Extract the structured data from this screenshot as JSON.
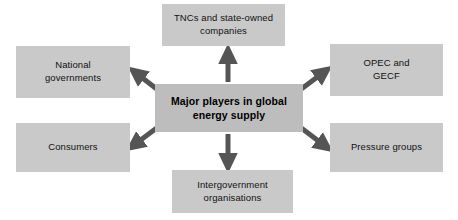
{
  "diagram": {
    "type": "hub-and-spoke",
    "colors": {
      "node_fill": "#c9c9c9",
      "center_fill": "#bdbdbd",
      "arrow": "#555555",
      "text": "#111111",
      "background": "#ffffff"
    },
    "center": {
      "id": "center",
      "label": "Major players in global energy supply",
      "line1": "Major players in global",
      "line2": "energy supply"
    },
    "nodes": [
      {
        "id": "tncs",
        "label": "TNCs and state-owned companies",
        "line1": "TNCs and state-owned",
        "line2": "companies",
        "position": "top"
      },
      {
        "id": "national",
        "label": "National governments",
        "line1": "National",
        "line2": "governments",
        "position": "top-left"
      },
      {
        "id": "opec",
        "label": "OPEC and GECF",
        "line1": "OPEC and",
        "line2": "GECF",
        "position": "top-right"
      },
      {
        "id": "consumers",
        "label": "Consumers",
        "line1": "Consumers",
        "line2": "",
        "position": "bottom-left"
      },
      {
        "id": "pressure",
        "label": "Pressure groups",
        "line1": "Pressure groups",
        "line2": "",
        "position": "bottom-right"
      },
      {
        "id": "intergov",
        "label": "Intergovernment organisations",
        "line1": "Intergovernment",
        "line2": "organisations",
        "position": "bottom"
      }
    ],
    "connections": [
      {
        "from": "center",
        "to": "tncs",
        "direction": "up",
        "arrowheads": "single"
      },
      {
        "from": "center",
        "to": "national",
        "direction": "up-left",
        "arrowheads": "single"
      },
      {
        "from": "center",
        "to": "opec",
        "direction": "up-right",
        "arrowheads": "single"
      },
      {
        "from": "center",
        "to": "consumers",
        "direction": "down-left",
        "arrowheads": "single"
      },
      {
        "from": "center",
        "to": "pressure",
        "direction": "down-right",
        "arrowheads": "single"
      },
      {
        "from": "center",
        "to": "intergov",
        "direction": "down",
        "arrowheads": "single"
      }
    ]
  }
}
